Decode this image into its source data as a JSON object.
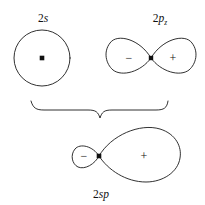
{
  "figure": {
    "kind": "orbital-hybridization-diagram",
    "background_color": "#ffffff",
    "stroke_color": "#1a1a1a",
    "text_color": "#111111",
    "width": 205,
    "height": 205
  },
  "orbitals": {
    "s_orbital": {
      "name": "2s atomic orbital",
      "label_numeral": "2",
      "label_symbol": "s",
      "label_full": "2s",
      "shape": "circle",
      "center_x": 42,
      "center_y": 58,
      "radius": 28,
      "nucleus_marker": "square-dot",
      "signs": []
    },
    "p_orbital": {
      "name": "2p z atomic orbital",
      "label_numeral": "2",
      "label_symbol": "p",
      "label_subscript": "z",
      "label_full": "2pz",
      "shape": "figure-eight",
      "center_x": 151,
      "center_y": 58,
      "left_extent": 107,
      "right_extent": 196,
      "nucleus_marker": "square-dot",
      "left_lobe_sign": "−",
      "right_lobe_sign": "+"
    },
    "sp_orbital": {
      "name": "2sp hybrid orbital",
      "label_numeral": "2",
      "label_symbol": "sp",
      "label_full": "2sp",
      "shape": "asymmetric-figure-eight",
      "node_x": 99,
      "node_y": 156,
      "left_extent": 73,
      "right_extent": 180,
      "nucleus_marker": "square-dot",
      "small_lobe_sign": "−",
      "large_lobe_sign": "+"
    }
  },
  "brace": {
    "name": "combination-brace",
    "orientation": "down",
    "left_x": 31,
    "right_x": 168,
    "top_y": 101,
    "tip_x": 100,
    "tip_y": 118
  },
  "signs": {
    "minus": "−",
    "plus": "+"
  }
}
